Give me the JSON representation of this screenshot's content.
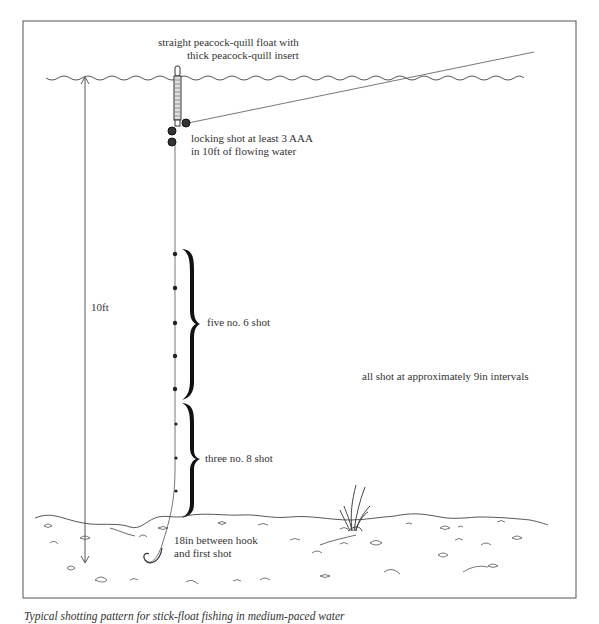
{
  "diagram": {
    "labels": {
      "float": [
        "straight peacock-quill float with",
        "thick peacock-quill insert"
      ],
      "locking_shot": [
        "locking shot at least 3 AAA",
        "in 10ft of flowing water"
      ],
      "depth": "10ft",
      "group_no6": "five no. 6 shot",
      "group_no8": "three no. 8 shot",
      "spacing_note": "all shot at approximately 9in intervals",
      "hook_note": [
        "18in between hook",
        "and first shot"
      ]
    },
    "elements": {
      "water_surface": "wavy line",
      "float": "peacock-quill float",
      "line_to_rod": "line",
      "locking_shot_count": 3,
      "no6_shot_count": 5,
      "no8_shot_count": 3,
      "river_bed": "stony bed with weed",
      "depth_arrow": "double-headed arrow"
    },
    "colors": {
      "ink": "#2a2a2a",
      "background": "#ffffff",
      "border": "#555555"
    }
  },
  "caption": "Typical shotting pattern for stick-float fishing in medium-paced water"
}
